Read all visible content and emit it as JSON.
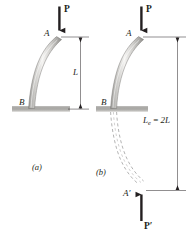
{
  "figure": {
    "background_color": "#ffffff",
    "ink_color": "#231f20",
    "column_fill_light": "#f2f1ef",
    "column_fill_mid": "#bcbbb8",
    "column_fill_dark": "#8b8a87",
    "support_color": "#a8a7a4",
    "dashed_color": "#9a999a"
  },
  "panel_a": {
    "caption": "(a)",
    "load_label": "P",
    "top_point_label": "A",
    "base_point_label": "B",
    "dimension_label": "L",
    "dimension_description": "column length L from A to B"
  },
  "panel_b": {
    "caption": "(b)",
    "load_label": "P",
    "top_point_label": "A",
    "base_point_label": "B",
    "mirror_point_label": "A′",
    "mirror_load_label": "P′",
    "effective_length_symbol": "L",
    "effective_length_subscript": "e",
    "effective_length_equals": " = ",
    "effective_length_value": "2L",
    "effective_length_full": "Le = 2L"
  }
}
